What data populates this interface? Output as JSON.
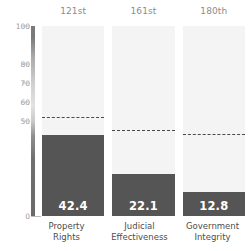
{
  "chart_data": {
    "type": "bar",
    "title": "",
    "subtitle": "",
    "xlabel": "",
    "ylabel": "",
    "ylim": [
      0,
      100
    ],
    "grid": false,
    "legend": "none",
    "categories": [
      "Property Rights",
      "Judicial Effectiveness",
      "Government Integrity"
    ],
    "category_lines": [
      [
        "Property",
        "Rights"
      ],
      [
        "Judicial",
        "Effectiveness"
      ],
      [
        "Government",
        "Integrity"
      ]
    ],
    "values": [
      42.4,
      22.1,
      12.8
    ],
    "value_labels": [
      "42.4",
      "22.1",
      "12.8"
    ],
    "rank_labels": [
      "121st",
      "161st",
      "180th"
    ],
    "reference_lines": [
      52.0,
      45.5,
      43.0
    ],
    "ytick_labels": [
      "100",
      "80",
      "70",
      "60",
      "50",
      "0"
    ],
    "ytick_values": [
      100,
      80,
      70,
      60,
      50,
      0
    ],
    "series": [
      {
        "name": "Score",
        "values": [
          42.4,
          22.1,
          12.8
        ]
      },
      {
        "name": "Reference average",
        "values": [
          52.0,
          45.5,
          43.0
        ]
      }
    ],
    "colors": {
      "bar": "#555555",
      "panel": "#f4f4f4",
      "reference_line": "#4a4a4a",
      "value_text": "#ffffff",
      "tick_text": "#9a9a9a",
      "rank_text": "#8c8c8c",
      "category_text": "#4d4d4d",
      "background": "#ffffff"
    }
  }
}
